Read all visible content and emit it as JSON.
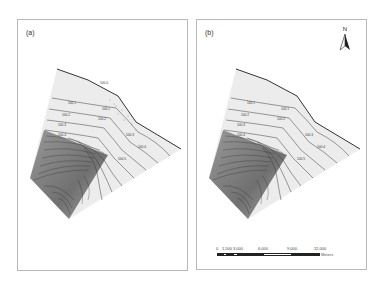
{
  "figure": {
    "panels": [
      {
        "id": "a",
        "label": "(a)"
      },
      {
        "id": "b",
        "label": "(b)"
      }
    ],
    "north_arrow": {
      "label": "N"
    },
    "scale_bar": {
      "ticks": [
        "0",
        "1,500",
        "3,000",
        "6,000",
        "9,000",
        "12,000"
      ],
      "unit": "Meters"
    },
    "contour_labels_a": [
      "100.0",
      "100.1",
      "100.1",
      "100.2",
      "100.2",
      "100.3",
      "100.3",
      "100.4",
      "100.4",
      "100.5"
    ],
    "contour_labels_b": [
      "100.1",
      "100.1",
      "100.2",
      "100.2",
      "100.3",
      "100.3",
      "100.4",
      "100.4",
      "100.5"
    ],
    "colors": {
      "map_fill": "#ececec",
      "shaded_wedge": "#6a6a6a",
      "contour": "#3a3a3a",
      "coastline": "#333333",
      "panel_border": "#b8b8b8"
    }
  }
}
